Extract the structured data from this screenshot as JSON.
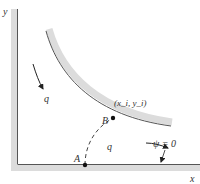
{
  "figure": {
    "axes": {
      "x_label": "x",
      "y_label": "y"
    },
    "points": [
      {
        "id": "A",
        "label": "A"
      },
      {
        "id": "B",
        "label": "B",
        "coord_label": "(x_i, y_i)"
      }
    ],
    "flow_labels": {
      "q_upper": "q",
      "q_lower": "q"
    },
    "streamline_label": "ψ = 0",
    "colors": {
      "wall_fill": "#d9d9d9",
      "wall_edge": "#555555",
      "ink": "#222222",
      "background": "#ffffff"
    }
  }
}
